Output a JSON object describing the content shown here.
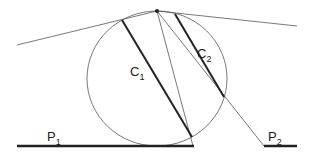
{
  "diagram": {
    "type": "geometry",
    "colors": {
      "thin_line": "#555555",
      "thick_line": "#222222",
      "background": "#ffffff"
    },
    "apex_point": {
      "x": 157,
      "y": 11,
      "r": 2
    },
    "circle": {
      "cx": 157,
      "cy": 78.5,
      "rx": 70,
      "ry": 67.5
    },
    "tangent_left": {
      "x1": 17,
      "y1": 45,
      "x2": 157,
      "y2": 11
    },
    "tangent_right": {
      "x1": 157,
      "y1": 11,
      "x2": 297,
      "y2": 26
    },
    "ray_to_p1_end": {
      "x1": 157,
      "y1": 11,
      "x2": 193,
      "y2": 146
    },
    "ray_to_p2_start": {
      "x1": 157,
      "y1": 11,
      "x2": 264,
      "y2": 146
    },
    "chords": [
      {
        "id": "C1",
        "label": "C",
        "sub": "1",
        "x1": 122,
        "y1": 20,
        "x2": 192,
        "y2": 137,
        "label_x": 130,
        "label_y": 76
      },
      {
        "id": "C2",
        "label": "C",
        "sub": "2",
        "x1": 175,
        "y1": 14,
        "x2": 224,
        "y2": 97,
        "label_x": 197,
        "label_y": 58
      }
    ],
    "planes": [
      {
        "id": "P1",
        "label": "P",
        "sub": "1",
        "x1": 17,
        "y1": 146,
        "x2": 194,
        "y2": 146,
        "label_x": 47,
        "label_y": 141
      },
      {
        "id": "P2",
        "label": "P",
        "sub": "2",
        "x1": 264,
        "y1": 146,
        "x2": 297,
        "y2": 146,
        "label_x": 268,
        "label_y": 141
      }
    ]
  }
}
